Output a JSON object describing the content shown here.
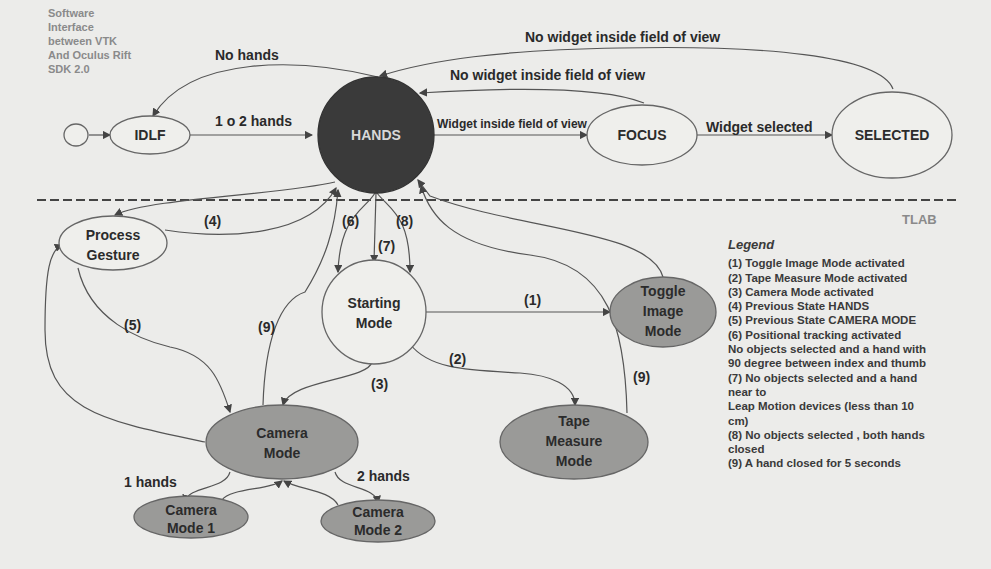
{
  "header": {
    "lines": [
      "Software",
      "Interface",
      "between VTK",
      "And Oculus Rift",
      "SDK 2.0"
    ]
  },
  "watermark": "TLAB",
  "nodes": {
    "start": {
      "label": ""
    },
    "idle": {
      "label": "IDLF"
    },
    "hands": {
      "label": "HANDS"
    },
    "focus": {
      "label": "FOCUS"
    },
    "selected": {
      "label": "SELECTED"
    },
    "process_gesture": {
      "line1": "Process",
      "line2": "Gesture"
    },
    "starting_mode": {
      "line1": "Starting",
      "line2": "Mode"
    },
    "toggle_image_mode": {
      "line1": "Toggle",
      "line2": "Image",
      "line3": "Mode"
    },
    "camera_mode": {
      "line1": "Camera",
      "line2": "Mode"
    },
    "tape_measure_mode": {
      "line1": "Tape",
      "line2": "Measure",
      "line3": "Mode"
    },
    "camera_mode_1": {
      "line1": "Camera",
      "line2": "Mode 1"
    },
    "camera_mode_2": {
      "line1": "Camera",
      "line2": "Mode 2"
    }
  },
  "edges": {
    "no_hands": "No hands",
    "one_or_two_hands": "1 o 2 hands",
    "no_widget_outer": "No widget inside field of view",
    "no_widget_inner": "No widget inside field of view",
    "widget_inside": "Widget inside field of view",
    "widget_selected": "Widget selected",
    "e1": "(1)",
    "e2": "(2)",
    "e3": "(3)",
    "e4": "(4)",
    "e5": "(5)",
    "e6": "(6)",
    "e7": "(7)",
    "e8": "(8)",
    "e9_left": "(9)",
    "e9_right": "(9)",
    "one_hands": "1 hands",
    "two_hands": "2 hands"
  },
  "legend": {
    "title": "Legend",
    "items": [
      "(1) Toggle Image Mode activated",
      "(2) Tape Measure Mode activated",
      "(3) Camera Mode activated",
      "(4) Previous State HANDS",
      "(5) Previous State CAMERA MODE",
      "(6) Positional tracking activated",
      "No objects selected and a hand with",
      "90 degree between index and thumb",
      "(7) No objects selected and a hand",
      "near to",
      "Leap Motion devices (less than 10",
      "cm)",
      "(8) No objects selected , both hands",
      "closed",
      "(9) A hand closed for 5 seconds"
    ]
  },
  "colors": {
    "background": "#ececea",
    "hands_node": "#3a3a3a",
    "grey_node": "#9a9a98",
    "light_node": "#efefec"
  }
}
